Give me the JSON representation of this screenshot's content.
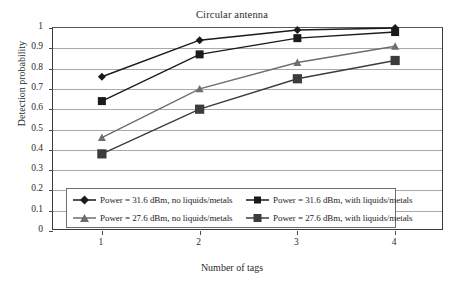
{
  "chart_data": {
    "type": "line",
    "title": "Circular antenna",
    "xlabel": "Number of tags",
    "ylabel": "Detection probability",
    "categories": [
      "1",
      "2",
      "3",
      "4"
    ],
    "x": [
      1,
      2,
      3,
      4
    ],
    "xlim": [
      0.5,
      4.5
    ],
    "ylim": [
      0,
      1
    ],
    "yticks": [
      "0",
      "0.1",
      "0.2",
      "0.3",
      "0.4",
      "0.5",
      "0.6",
      "0.7",
      "0.8",
      "0.9",
      "1"
    ],
    "ytick_values": [
      0,
      0.1,
      0.2,
      0.3,
      0.4,
      0.5,
      0.6,
      0.7,
      0.8,
      0.9,
      1
    ],
    "grid": "horizontal",
    "legend_position": "inside-bottom",
    "series": [
      {
        "name": "Power = 31.6 dBm, no liquids/metals",
        "marker": "diamond",
        "color": "#1a1a1a",
        "values": [
          0.76,
          0.94,
          0.99,
          1.0
        ]
      },
      {
        "name": "Power = 31.6 dBm, with liquids/metals",
        "marker": "square",
        "color": "#1a1a1a",
        "values": [
          0.64,
          0.87,
          0.95,
          0.98
        ]
      },
      {
        "name": "Power = 27.6 dBm, no liquids/metals",
        "marker": "triangle",
        "color": "#6e6e6e",
        "values": [
          0.46,
          0.7,
          0.83,
          0.91
        ]
      },
      {
        "name": "Power = 27.6 dBm, with liquids/metals",
        "marker": "square",
        "color": "#3c3c3c",
        "values": [
          0.38,
          0.6,
          0.75,
          0.84
        ]
      }
    ]
  },
  "legend": {
    "entries": [
      "Power = 31.6 dBm, no liquids/metals",
      "Power = 31.6 dBm, with liquids/metals",
      "Power = 27.6 dBm, no liquids/metals",
      "Power = 27.6 dBm, with liquids/metals"
    ]
  }
}
